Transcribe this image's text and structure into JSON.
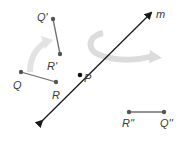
{
  "diagram": {
    "line": {
      "label": "m",
      "color": "#1a1a1a"
    },
    "point_p": {
      "label": "P"
    },
    "segment_original": {
      "p1": "Q",
      "p2": "R"
    },
    "segment_rotated": {
      "p1": "Q'",
      "p2": "R'"
    },
    "segment_reflected": {
      "p1": "R''",
      "p2": "Q''"
    },
    "colors": {
      "segment": "#6e6e6e",
      "point": "#555555",
      "arrow_fill": "#e3e3e3",
      "arrow_stroke": "#cfcfcf"
    }
  }
}
